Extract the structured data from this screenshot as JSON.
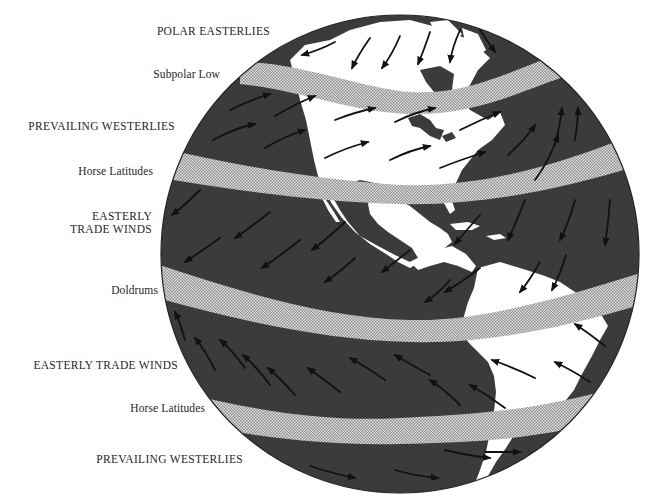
{
  "diagram": {
    "labels": [
      {
        "id": "polar-easterlies",
        "text": "POLAR EASTERLIES",
        "kind": "wind"
      },
      {
        "id": "subpolar-low",
        "text": "Subpolar Low",
        "kind": "pressure-zone"
      },
      {
        "id": "prevailing-westerlies-north",
        "text": "PREVAILING WESTERLIES",
        "kind": "wind"
      },
      {
        "id": "horse-latitudes-north",
        "text": "Horse Latitudes",
        "kind": "pressure-zone"
      },
      {
        "id": "easterly-trade-winds-north-line1",
        "text": "EASTERLY",
        "kind": "wind"
      },
      {
        "id": "easterly-trade-winds-north-line2",
        "text": "TRADE WINDS",
        "kind": "wind"
      },
      {
        "id": "doldrums",
        "text": "Doldrums",
        "kind": "pressure-zone"
      },
      {
        "id": "easterly-trade-winds-south",
        "text": "EASTERLY TRADE WINDS",
        "kind": "wind"
      },
      {
        "id": "horse-latitudes-south",
        "text": "Horse Latitudes",
        "kind": "pressure-zone"
      },
      {
        "id": "prevailing-westerlies-south",
        "text": "PREVAILING WESTERLIES",
        "kind": "wind"
      }
    ],
    "colors": {
      "ocean": "#3a3a3a",
      "land": "#ffffff",
      "band": "#cfcfcf",
      "arrow": "#111111",
      "text": "#262626"
    }
  }
}
